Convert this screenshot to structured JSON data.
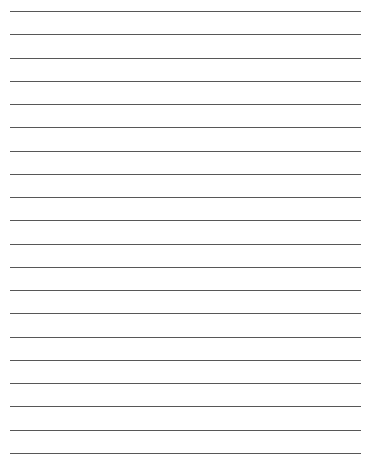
{
  "page": {
    "type": "lined-paper",
    "line_count": 20,
    "first_line_y": 11,
    "line_spacing": 23.26,
    "line_left": 10,
    "line_right": 361,
    "line_color": "#3a3a3a",
    "background_color": "#ffffff"
  }
}
